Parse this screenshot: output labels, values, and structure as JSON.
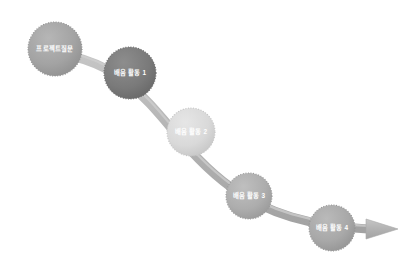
{
  "diagram": {
    "type": "process-flow-curve",
    "title": "",
    "orientation": "descending-left-to-right",
    "background_color": "#ffffff",
    "ribbon": {
      "name": "flow-arrow",
      "fill_color": "#b5b5b5",
      "edge_color": "#9c9c9c",
      "thickness_px": 9,
      "arrowhead": "triangle-right",
      "arrowhead_label": "arrow-right-icon"
    },
    "nodes": [
      {
        "id": "node-1",
        "label": "프로젝트질문",
        "order": 1,
        "cx": 55,
        "cy": 49,
        "r": 27,
        "fill_color": "#a3a3a3",
        "border_style": "dotted",
        "border_color": "#8f8f8f",
        "text_color": "#ffffff",
        "font_size": 6.4
      },
      {
        "id": "node-2",
        "label": "배움 활동 1",
        "order": 2,
        "cx": 130,
        "cy": 73,
        "r": 26,
        "fill_color": "#7a7a7a",
        "border_style": "dotted",
        "border_color": "#6b6b6b",
        "text_color": "#ffffff",
        "font_size": 6.4
      },
      {
        "id": "node-3",
        "label": "배움 활동 2",
        "order": 3,
        "cx": 191,
        "cy": 132,
        "r": 24,
        "fill_color": "#d9d9d9",
        "border_style": "dotted",
        "border_color": "#c4c4c4",
        "text_color": "#ffffff",
        "font_size": 6.4
      },
      {
        "id": "node-4",
        "label": "배움 활동 3",
        "order": 4,
        "cx": 249,
        "cy": 196,
        "r": 23,
        "fill_color": "#adadad",
        "border_style": "dotted",
        "border_color": "#999999",
        "text_color": "#ffffff",
        "font_size": 6.4
      },
      {
        "id": "node-5",
        "label": "배움 활동 4",
        "order": 5,
        "cx": 332,
        "cy": 228,
        "r": 23,
        "fill_color": "#a8a8a8",
        "border_style": "dotted",
        "border_color": "#949494",
        "text_color": "#ffffff",
        "font_size": 6.4
      }
    ]
  }
}
